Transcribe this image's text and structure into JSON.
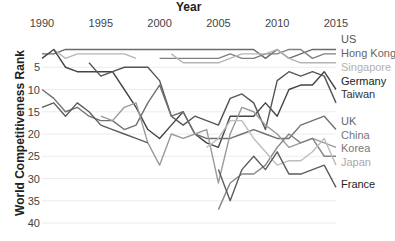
{
  "chart_data": {
    "type": "line",
    "title": "",
    "xlabel": "Year",
    "ylabel": "World Competitiveness Rank",
    "x_axis_position": "top",
    "y_axis_inverted": true,
    "xlim": [
      1990,
      2015
    ],
    "ylim": [
      0,
      40
    ],
    "x_ticks": [
      "1990",
      "1995",
      "2000",
      "2005",
      "2010",
      "2015"
    ],
    "y_ticks": [
      "5",
      "10",
      "15",
      "20",
      "25",
      "30",
      "35",
      "40"
    ],
    "grid": true,
    "legend_position": "right, inline at line ends",
    "x": [
      1990,
      1991,
      1992,
      1993,
      1994,
      1995,
      1996,
      1997,
      1998,
      1999,
      2000,
      2001,
      2002,
      2003,
      2004,
      2005,
      2006,
      2007,
      2008,
      2009,
      2010,
      2011,
      2012,
      2013,
      2014,
      2015
    ],
    "series": [
      {
        "name": "US",
        "color": "#6b6b6b",
        "values": [
          2,
          2,
          1,
          1,
          1,
          1,
          1,
          1,
          1,
          1,
          1,
          1,
          1,
          1,
          1,
          1,
          1,
          1,
          1,
          3,
          1,
          3,
          2,
          1,
          1,
          1
        ]
      },
      {
        "name": "Hong Kong",
        "color": "#7f7f7f",
        "values": [
          null,
          null,
          null,
          null,
          null,
          null,
          null,
          null,
          null,
          null,
          3,
          3,
          3,
          3,
          3,
          3,
          2,
          3,
          3,
          2,
          2,
          1,
          1,
          3,
          2,
          2
        ]
      },
      {
        "name": "Singapore",
        "color": "#b5b5b5",
        "values": [
          null,
          1,
          3,
          2,
          2,
          2,
          2,
          2,
          3,
          null,
          null,
          2,
          4,
          4,
          4,
          4,
          3,
          2,
          2,
          2,
          1,
          3,
          4,
          4,
          4,
          4
        ]
      },
      {
        "name": "Germany",
        "color": "#444444",
        "values": [
          3,
          1,
          5,
          6,
          6,
          6,
          6,
          10,
          14,
          19,
          21,
          18,
          15,
          20,
          22,
          23,
          16,
          16,
          16,
          13,
          16,
          10,
          9,
          9,
          6,
          10
        ]
      },
      {
        "name": "Taiwan",
        "color": "#555555",
        "values": [
          null,
          null,
          null,
          null,
          4,
          7,
          6,
          5,
          5,
          5,
          8,
          16,
          18,
          16,
          17,
          18,
          12,
          11,
          13,
          19,
          8,
          6,
          7,
          6,
          7,
          13
        ]
      },
      {
        "name": "UK",
        "color": "#707070",
        "values": [
          10,
          12,
          15,
          14,
          16,
          17,
          17,
          19,
          18,
          13,
          9,
          16,
          15,
          20,
          21,
          21,
          21,
          20,
          19,
          20,
          21,
          21,
          18,
          17,
          16,
          19
        ]
      },
      {
        "name": "China",
        "color": "#9a9a9a",
        "values": [
          null,
          null,
          null,
          null,
          null,
          16,
          17,
          14,
          13,
          22,
          27,
          20,
          21,
          20,
          19,
          31,
          20,
          14,
          15,
          18,
          20,
          23,
          22,
          21,
          22,
          23
        ]
      },
      {
        "name": "Korea",
        "color": "#858585",
        "values": [
          null,
          null,
          null,
          null,
          null,
          null,
          null,
          null,
          null,
          null,
          null,
          null,
          null,
          null,
          null,
          37,
          31,
          29,
          29,
          27,
          23,
          20,
          22,
          21,
          25,
          25
        ]
      },
      {
        "name": "Japan",
        "color": "#bdbdbd",
        "values": [
          null,
          null,
          null,
          null,
          null,
          null,
          null,
          null,
          null,
          null,
          null,
          null,
          null,
          null,
          23,
          21,
          17,
          17,
          21,
          24,
          27,
          26,
          26,
          24,
          21,
          27
        ]
      },
      {
        "name": "France",
        "color": "#5c5c5c",
        "values": [
          14,
          13,
          16,
          13,
          15,
          18,
          19,
          20,
          21,
          22,
          null,
          null,
          null,
          null,
          null,
          28,
          35,
          28,
          25,
          28,
          24,
          29,
          29,
          28,
          27,
          32
        ]
      }
    ]
  },
  "labels": {
    "x_title": "Year",
    "y_title": "World Competitiveness Rank"
  },
  "legend": [
    {
      "name": "US",
      "y": 39,
      "color": "#555555"
    },
    {
      "name": "Hong Kong",
      "y": 53,
      "color": "#666666"
    },
    {
      "name": "Singapore",
      "y": 67,
      "color": "#b0b0b0"
    },
    {
      "name": "Germany",
      "y": 81,
      "color": "#222222"
    },
    {
      "name": "Taiwan",
      "y": 94,
      "color": "#333333"
    },
    {
      "name": "UK",
      "y": 121,
      "color": "#666666"
    },
    {
      "name": "China",
      "y": 135,
      "color": "#777777"
    },
    {
      "name": "Korea",
      "y": 148,
      "color": "#777777"
    },
    {
      "name": "Japan",
      "y": 162,
      "color": "#aaaaaa"
    },
    {
      "name": "France",
      "y": 184,
      "color": "#222222"
    }
  ]
}
